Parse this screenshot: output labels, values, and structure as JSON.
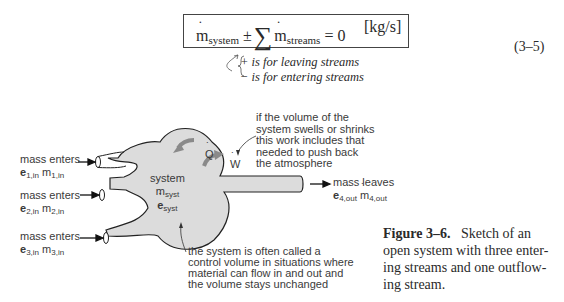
{
  "equation": {
    "lhs_symbol": "m",
    "lhs_subscript": "system",
    "operator": "±",
    "sum_symbol": "∑",
    "term_symbol": "m",
    "term_subscript": "streams",
    "rhs": "= 0",
    "units": "[kg/s]",
    "number": "(3–5)",
    "notes": [
      "+ is for leaving streams",
      "− is for entering streams"
    ]
  },
  "diagram": {
    "inlets": [
      {
        "label": "mass enters",
        "e": "e",
        "e_sub": "1,in",
        "m": "m",
        "m_sub": "1,in"
      },
      {
        "label": "mass enters",
        "e": "e",
        "e_sub": "2,in",
        "m": "m",
        "m_sub": "2,in"
      },
      {
        "label": "mass enters",
        "e": "e",
        "e_sub": "3,in",
        "m": "m",
        "m_sub": "3,in"
      }
    ],
    "outlet": {
      "label": "mass leaves",
      "e": "e",
      "e_sub": "4,out",
      "m": "m",
      "m_sub": "4,out"
    },
    "system": {
      "title": "system",
      "m": "m",
      "m_sub": "syst",
      "e": "e",
      "e_sub": "syst"
    },
    "heat_symbol": "Q",
    "work_symbol": "W",
    "work_note": [
      "if the volume of the",
      "system swells or shrinks",
      "this work includes that",
      "needed to push back",
      "the atmosphere"
    ],
    "cv_note": [
      "the system is often called a",
      "control volume in situations where",
      "material can flow in and out and",
      "the volume stays unchanged"
    ],
    "colors": {
      "blob_fill": "#dcdcdc",
      "outline": "#222222",
      "arrow_gray": "#8a8a8a"
    }
  },
  "caption": {
    "label": "Figure 3–6.",
    "text": "Sketch of an open system with three entering streams and one outflowing stream.",
    "lines": [
      "Sketch of an",
      "open system with three enter-",
      "ing streams and one outflow-",
      "ing stream."
    ]
  }
}
